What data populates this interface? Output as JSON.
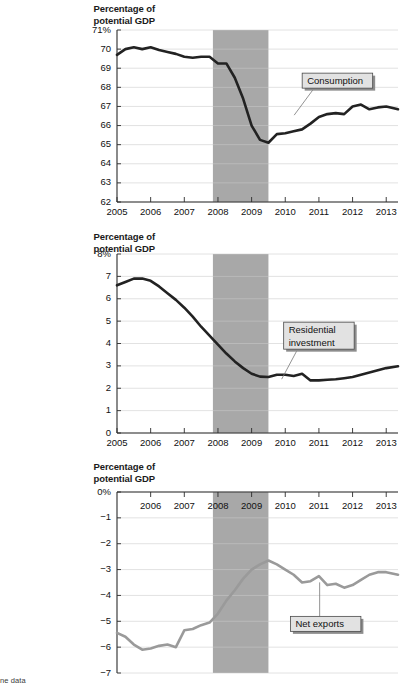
{
  "figure": {
    "axis_caption_line1": "Percentage of",
    "axis_caption_line2": "potential GDP",
    "footnote": "ne data",
    "recession_band": {
      "start": 2007.85,
      "end": 2009.5,
      "color": "#a8a8a8"
    }
  },
  "chart_data": [
    {
      "type": "line",
      "title": "",
      "xlabel": "",
      "ylabel": "Percentage of potential GDP",
      "series_name": "Consumption",
      "line_color": "#222222",
      "xlim": [
        2005,
        2013.35
      ],
      "ylim": [
        62,
        71
      ],
      "yticks": [
        71,
        70,
        69,
        68,
        67,
        66,
        65,
        64,
        63,
        62
      ],
      "ytick_labels": [
        "71%",
        "70",
        "69",
        "68",
        "67",
        "66",
        "65",
        "64",
        "63",
        "62"
      ],
      "xticks": [
        2005,
        2006,
        2007,
        2008,
        2009,
        2010,
        2011,
        2012,
        2013
      ],
      "xtick_labels": [
        "2005",
        "2006",
        "2007",
        "2008",
        "2009",
        "2010",
        "2011",
        "2012",
        "2013"
      ],
      "annotation": {
        "label": "Consumption",
        "x": 2011.55,
        "y": 68.35
      },
      "x": [
        2005.0,
        2005.25,
        2005.5,
        2005.75,
        2006.0,
        2006.25,
        2006.5,
        2006.75,
        2007.0,
        2007.25,
        2007.5,
        2007.75,
        2008.0,
        2008.25,
        2008.5,
        2008.75,
        2009.0,
        2009.25,
        2009.5,
        2009.75,
        2010.0,
        2010.25,
        2010.5,
        2010.75,
        2011.0,
        2011.25,
        2011.5,
        2011.75,
        2012.0,
        2012.25,
        2012.5,
        2012.75,
        2013.0,
        2013.35
      ],
      "values": [
        69.7,
        70.0,
        70.1,
        70.0,
        70.1,
        69.95,
        69.85,
        69.75,
        69.6,
        69.55,
        69.6,
        69.6,
        69.25,
        69.25,
        68.5,
        67.4,
        66.0,
        65.25,
        65.1,
        65.55,
        65.6,
        65.7,
        65.8,
        66.1,
        66.45,
        66.6,
        66.65,
        66.6,
        67.0,
        67.1,
        66.85,
        66.95,
        67.0,
        66.85
      ]
    },
    {
      "type": "line",
      "title": "",
      "xlabel": "",
      "ylabel": "Percentage of potential GDP",
      "series_name": "Residential investment",
      "line_color": "#222222",
      "xlim": [
        2005,
        2013.35
      ],
      "ylim": [
        0,
        8
      ],
      "yticks": [
        8,
        7,
        6,
        5,
        4,
        3,
        2,
        1,
        0
      ],
      "ytick_labels": [
        "8%",
        "7",
        "6",
        "5",
        "4",
        "3",
        "2",
        "1",
        "0"
      ],
      "xticks": [
        2005,
        2006,
        2007,
        2008,
        2009,
        2010,
        2011,
        2012,
        2013
      ],
      "xtick_labels": [
        "2005",
        "2006",
        "2007",
        "2008",
        "2009",
        "2010",
        "2011",
        "2012",
        "2013"
      ],
      "annotation": {
        "label_line1": "Residential",
        "label_line2": "investment",
        "x": 2011.0,
        "y": 4.35
      },
      "x": [
        2005.0,
        2005.25,
        2005.5,
        2005.75,
        2006.0,
        2006.25,
        2006.5,
        2006.75,
        2007.0,
        2007.25,
        2007.5,
        2007.75,
        2008.0,
        2008.25,
        2008.5,
        2008.75,
        2009.0,
        2009.25,
        2009.5,
        2009.75,
        2010.0,
        2010.25,
        2010.5,
        2010.75,
        2011.0,
        2011.25,
        2011.5,
        2011.75,
        2012.0,
        2012.25,
        2012.5,
        2012.75,
        2013.0,
        2013.35
      ],
      "values": [
        6.6,
        6.75,
        6.9,
        6.9,
        6.8,
        6.55,
        6.25,
        5.95,
        5.6,
        5.2,
        4.75,
        4.35,
        3.95,
        3.55,
        3.2,
        2.9,
        2.65,
        2.52,
        2.5,
        2.6,
        2.6,
        2.55,
        2.65,
        2.35,
        2.35,
        2.38,
        2.4,
        2.45,
        2.5,
        2.6,
        2.7,
        2.8,
        2.9,
        2.98
      ]
    },
    {
      "type": "line",
      "title": "",
      "xlabel": "",
      "ylabel": "Percentage of potential GDP",
      "series_name": "Net exports",
      "line_color": "#9a9a9a",
      "xlim": [
        2005,
        2013.35
      ],
      "ylim": [
        -7,
        0
      ],
      "yticks": [
        0,
        -1,
        -2,
        -3,
        -4,
        -5,
        -6,
        -7
      ],
      "ytick_labels": [
        "0%",
        "−1",
        "−2",
        "−3",
        "−4",
        "−5",
        "−6",
        "−7"
      ],
      "xticks": [
        2006,
        2007,
        2008,
        2009,
        2010,
        2011,
        2012,
        2013
      ],
      "xtick_labels": [
        "2006",
        "2007",
        "2008",
        "2009",
        "2010",
        "2011",
        "2012",
        "2013"
      ],
      "annotation": {
        "label": "Net exports",
        "x": 2011.2,
        "y": -5.1
      },
      "x": [
        2005.0,
        2005.25,
        2005.5,
        2005.75,
        2006.0,
        2006.25,
        2006.5,
        2006.75,
        2007.0,
        2007.25,
        2007.5,
        2007.75,
        2008.0,
        2008.25,
        2008.5,
        2008.75,
        2009.0,
        2009.25,
        2009.5,
        2009.75,
        2010.0,
        2010.25,
        2010.5,
        2010.75,
        2011.0,
        2011.25,
        2011.5,
        2011.75,
        2012.0,
        2012.25,
        2012.5,
        2012.75,
        2013.0,
        2013.35
      ],
      "values": [
        -5.45,
        -5.6,
        -5.9,
        -6.1,
        -6.05,
        -5.95,
        -5.9,
        -6.0,
        -5.35,
        -5.3,
        -5.15,
        -5.05,
        -4.7,
        -4.2,
        -3.8,
        -3.35,
        -3.0,
        -2.8,
        -2.65,
        -2.8,
        -3.0,
        -3.2,
        -3.5,
        -3.45,
        -3.25,
        -3.6,
        -3.55,
        -3.7,
        -3.6,
        -3.4,
        -3.2,
        -3.1,
        -3.1,
        -3.2
      ]
    }
  ]
}
